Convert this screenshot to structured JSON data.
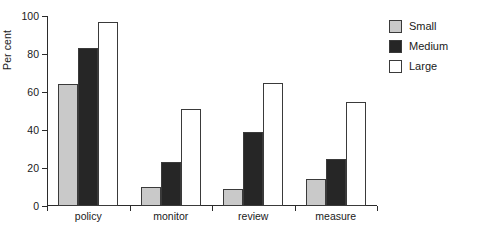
{
  "chart_data": {
    "type": "bar",
    "title": "",
    "xlabel": "",
    "ylabel": "Per cent",
    "categories": [
      "policy",
      "monitor",
      "review",
      "measure"
    ],
    "series": [
      {
        "name": "Small",
        "color": "#c9c9c9",
        "values": [
          64,
          10,
          9,
          14
        ]
      },
      {
        "name": "Medium",
        "color": "#262626",
        "values": [
          83,
          23,
          39,
          25
        ]
      },
      {
        "name": "Large",
        "color": "#ffffff",
        "values": [
          97,
          51,
          65,
          55
        ]
      }
    ],
    "ylim": [
      0,
      100
    ],
    "yticks": [
      0,
      20,
      40,
      60,
      80,
      100
    ],
    "ytick_labels": [
      "0",
      "20",
      "40",
      "60",
      "80",
      "100"
    ],
    "grid": false,
    "legend_position": "right"
  }
}
